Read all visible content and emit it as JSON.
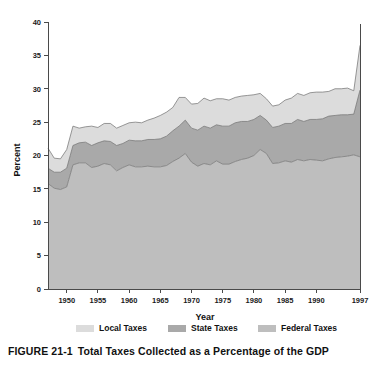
{
  "figure": {
    "number": "FIGURE 21-1",
    "caption": "Total Taxes Collected as a Percentage of the GDP"
  },
  "colors": {
    "local": "#dcdcdc",
    "state": "#a9a9a9",
    "federal": "#bebebe",
    "outline": "#6e6e6e",
    "axis": "#4a4a4a",
    "text": "#111111",
    "background": "#ffffff"
  },
  "legend": {
    "position": "bottom",
    "items": [
      {
        "label": "Local Taxes",
        "color": "#dcdcdc"
      },
      {
        "label": "State Taxes",
        "color": "#a9a9a9"
      },
      {
        "label": "Federal Taxes",
        "color": "#bebebe"
      }
    ]
  },
  "chart_data": {
    "type": "area",
    "stacked": true,
    "title": "Total Taxes Collected as a Percentage of the GDP",
    "xlabel": "Year",
    "ylabel": "Percent",
    "ylim": [
      0,
      40
    ],
    "xlim": [
      1947,
      1997
    ],
    "grid": false,
    "yticks": [
      0,
      5,
      10,
      15,
      20,
      25,
      30,
      35,
      40
    ],
    "ytick_labels": [
      "0",
      "5",
      "10",
      "15",
      "20",
      "25",
      "30",
      "35",
      "40"
    ],
    "xticks": [
      1950,
      1955,
      1960,
      1965,
      1970,
      1975,
      1980,
      1985,
      1990,
      1997
    ],
    "xtick_labels": [
      "1950",
      "1955",
      "1960",
      "1965",
      "1970",
      "1975",
      "1980",
      "1985",
      "1990",
      "1997"
    ],
    "x": [
      1947,
      1948,
      1949,
      1950,
      1951,
      1952,
      1953,
      1954,
      1955,
      1956,
      1957,
      1958,
      1959,
      1960,
      1961,
      1962,
      1963,
      1964,
      1965,
      1966,
      1967,
      1968,
      1969,
      1970,
      1971,
      1972,
      1973,
      1974,
      1975,
      1976,
      1977,
      1978,
      1979,
      1980,
      1981,
      1982,
      1983,
      1984,
      1985,
      1986,
      1987,
      1988,
      1989,
      1990,
      1991,
      1992,
      1993,
      1994,
      1995,
      1996,
      1997
    ],
    "series": [
      {
        "name": "Federal Taxes",
        "color": "#bebebe",
        "stack_order": 1,
        "values": [
          15.8,
          15.1,
          14.9,
          15.3,
          18.6,
          18.9,
          18.9,
          18.2,
          18.4,
          18.8,
          18.6,
          17.7,
          18.2,
          18.6,
          18.3,
          18.3,
          18.4,
          18.3,
          18.3,
          18.5,
          19.1,
          19.6,
          20.3,
          19.0,
          18.4,
          18.8,
          18.6,
          19.2,
          18.7,
          18.7,
          19.1,
          19.4,
          19.6,
          20.0,
          20.9,
          20.3,
          18.8,
          18.9,
          19.2,
          19.0,
          19.4,
          19.2,
          19.4,
          19.3,
          19.2,
          19.5,
          19.7,
          19.8,
          19.9,
          20.1,
          19.8
        ]
      },
      {
        "name": "State Taxes",
        "color": "#a9a9a9",
        "stack_order": 2,
        "values": [
          2.3,
          2.4,
          2.6,
          2.8,
          2.9,
          3.0,
          3.1,
          3.3,
          3.5,
          3.4,
          3.5,
          3.8,
          3.6,
          3.7,
          3.9,
          3.9,
          4.0,
          4.1,
          4.2,
          4.4,
          4.6,
          4.8,
          5.0,
          5.1,
          5.4,
          5.6,
          5.5,
          5.4,
          5.7,
          5.7,
          5.8,
          5.7,
          5.5,
          5.4,
          5.1,
          5.0,
          5.4,
          5.5,
          5.6,
          5.8,
          6.0,
          5.9,
          6.0,
          6.1,
          6.3,
          6.4,
          6.3,
          6.3,
          6.2,
          6.1,
          10.0
        ]
      },
      {
        "name": "Local Taxes",
        "color": "#dcdcdc",
        "stack_order": 3,
        "values": [
          3.0,
          2.1,
          2.0,
          2.8,
          2.9,
          2.2,
          2.3,
          2.9,
          2.3,
          2.6,
          2.7,
          2.6,
          2.7,
          2.6,
          2.8,
          2.7,
          2.9,
          3.2,
          3.5,
          3.6,
          3.5,
          4.3,
          3.4,
          3.6,
          4.0,
          4.2,
          4.1,
          3.9,
          4.1,
          3.9,
          3.8,
          3.8,
          3.9,
          3.7,
          3.3,
          3.2,
          3.2,
          3.2,
          3.5,
          3.8,
          3.9,
          3.9,
          4.0,
          4.1,
          4.0,
          3.7,
          4.0,
          3.9,
          4.0,
          3.5,
          6.7
        ]
      }
    ]
  }
}
